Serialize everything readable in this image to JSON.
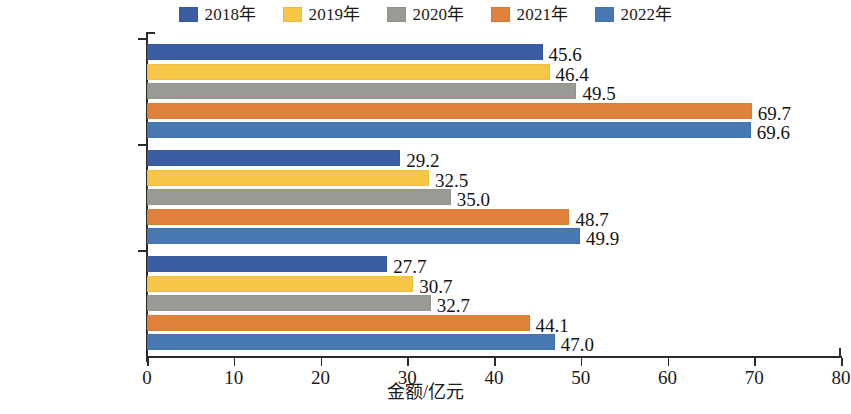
{
  "chart_data": {
    "type": "bar",
    "orientation": "horizontal",
    "title": "",
    "subtitle": "",
    "xlabel": "金额/亿元",
    "ylabel": "",
    "xlim": [
      0,
      80
    ],
    "xticks": [
      0,
      10,
      20,
      30,
      40,
      50,
      60,
      70,
      80
    ],
    "xtick_labels": [
      "0",
      "10",
      "20",
      "30",
      "40",
      "50",
      "60",
      "70",
      "80"
    ],
    "grid": false,
    "legend_position": "top-center",
    "categories": [
      "现金和股权\n总收入",
      "奖励个人",
      "研发与转化\n主要贡献人员"
    ],
    "series": [
      {
        "name": "2018年",
        "color": "#3a5da3",
        "values": [
          45.6,
          29.2,
          27.7
        ]
      },
      {
        "name": "2019年",
        "color": "#f6c746",
        "values": [
          46.4,
          32.5,
          30.7
        ]
      },
      {
        "name": "2020年",
        "color": "#9a9a95",
        "values": [
          49.5,
          35.0,
          32.7
        ]
      },
      {
        "name": "2021年",
        "color": "#e0823c",
        "values": [
          69.7,
          48.7,
          44.1
        ]
      },
      {
        "name": "2022年",
        "color": "#4878b4",
        "values": [
          69.6,
          49.9,
          47.0
        ]
      }
    ],
    "value_labels": [
      [
        "45.6",
        "46.4",
        "49.5",
        "69.7",
        "69.6"
      ],
      [
        "29.2",
        "32.5",
        "35.0",
        "48.7",
        "49.9"
      ],
      [
        "27.7",
        "30.7",
        "32.7",
        "44.1",
        "47.0"
      ]
    ]
  }
}
